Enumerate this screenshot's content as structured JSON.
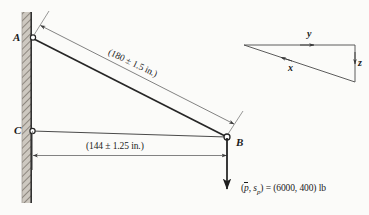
{
  "figure": {
    "type": "engineering-diagram",
    "points": [
      {
        "id": "A",
        "label": "A",
        "x": 33,
        "y": 37
      },
      {
        "id": "C",
        "label": "C",
        "x": 32,
        "y": 131
      },
      {
        "id": "B",
        "label": "B",
        "x": 227,
        "y": 137
      }
    ],
    "members": [
      {
        "name": "member-AB",
        "from": "A",
        "to": "B"
      },
      {
        "name": "member-CB",
        "from": "C",
        "to": "B"
      }
    ],
    "dimensions": [
      {
        "name": "dimension-AB",
        "label": "(180 ± 1.5 in.)",
        "nominal": 180,
        "tolerance": 1.5,
        "units": "in.",
        "orientation": "diagonal"
      },
      {
        "name": "dimension-CB",
        "label": "(144 ± 1.25 in.)",
        "nominal": 144,
        "tolerance": 1.25,
        "units": "in.",
        "orientation": "horizontal"
      }
    ],
    "load": {
      "name": "applied-load",
      "prefix": "(",
      "mean_symbol": "p",
      "comma": ", ",
      "sd_symbol": "s",
      "sd_subscript": "p",
      "equals": ") = (6000, 400) lb",
      "full_label": "(p̄, s_p) = (6000, 400) lb",
      "mean_value": 6000,
      "standard_deviation": 400,
      "units": "lb",
      "direction": "downward"
    },
    "axes": {
      "name": "coordinate-triad",
      "x_label": "x",
      "y_label": "y",
      "z_label": "z"
    },
    "wall": {
      "name": "fixed-wall",
      "style": "hatched"
    },
    "colors": {
      "line": "#262626",
      "thin_line": "#5a5a5a",
      "wall_fill": "#b8b3ab",
      "background": "#fbfbf9",
      "text": "#1a1a1a"
    }
  }
}
